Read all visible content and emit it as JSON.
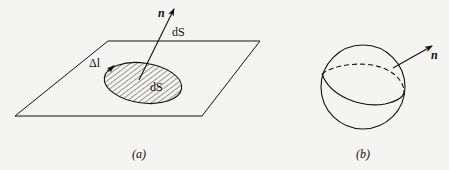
{
  "figure_a": {
    "caption": "(a)",
    "normal_label": "n",
    "vector_area_label": "dS",
    "boundary_label": "Δl",
    "area_label": "dS"
  },
  "figure_b": {
    "caption": "(b)",
    "normal_label": "n"
  },
  "colors": {
    "background": "#f4f4f2",
    "stroke": "#111111"
  }
}
